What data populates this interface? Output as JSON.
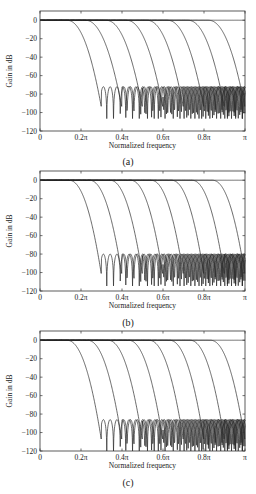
{
  "chart_data": [
    {
      "type": "line",
      "panel_label": "(a)",
      "title": "",
      "xlabel": "Normalized frequency",
      "ylabel": "Gain in dB",
      "xlim": [
        0,
        1
      ],
      "ylim": [
        -120,
        10
      ],
      "x_unit": "π",
      "xticks": [
        0,
        0.2,
        0.4,
        0.6,
        0.8,
        1.0
      ],
      "xtick_labels": [
        "0",
        "0.2π",
        "0.4π",
        "0.6π",
        "0.8π",
        "π"
      ],
      "yticks": [
        0,
        -20,
        -40,
        -60,
        -80,
        -100,
        -120
      ],
      "ytick_labels": [
        "0",
        "-20",
        "-40",
        "-60",
        "-80",
        "-100",
        "-120"
      ],
      "grid": false,
      "legend": null,
      "series_description": "Family of lowpass filter magnitude responses with passband edges stepping by 0.1π and stopband edges at 0.3π through π",
      "series": [
        {
          "name": "filter 1",
          "passband_edge": 0.13,
          "stopband_edge": 0.3,
          "stopband_peak_db": -70
        },
        {
          "name": "filter 2",
          "passband_edge": 0.22,
          "stopband_edge": 0.4,
          "stopband_peak_db": -70
        },
        {
          "name": "filter 3",
          "passband_edge": 0.32,
          "stopband_edge": 0.5,
          "stopband_peak_db": -70
        },
        {
          "name": "filter 4",
          "passband_edge": 0.42,
          "stopband_edge": 0.6,
          "stopband_peak_db": -70
        },
        {
          "name": "filter 5",
          "passband_edge": 0.52,
          "stopband_edge": 0.7,
          "stopband_peak_db": -70
        },
        {
          "name": "filter 6",
          "passband_edge": 0.62,
          "stopband_edge": 0.8,
          "stopband_peak_db": -70
        },
        {
          "name": "filter 7",
          "passband_edge": 0.72,
          "stopband_edge": 0.9,
          "stopband_peak_db": -70
        },
        {
          "name": "filter 8",
          "passband_edge": 0.82,
          "stopband_edge": 1.0,
          "stopband_peak_db": -70
        }
      ]
    },
    {
      "type": "line",
      "panel_label": "(b)",
      "title": "",
      "xlabel": "Normalized frequency",
      "ylabel": "Gain in dB",
      "xlim": [
        0,
        1
      ],
      "ylim": [
        -120,
        10
      ],
      "x_unit": "π",
      "xticks": [
        0,
        0.2,
        0.4,
        0.6,
        0.8,
        1.0
      ],
      "xtick_labels": [
        "0",
        "0.2π",
        "0.4π",
        "0.6π",
        "0.8π",
        "π"
      ],
      "yticks": [
        0,
        -20,
        -40,
        -60,
        -80,
        -100,
        -120
      ],
      "ytick_labels": [
        "0",
        "-20",
        "-40",
        "-60",
        "-80",
        "-100",
        "-120"
      ],
      "grid": false,
      "legend": null,
      "series": [
        {
          "name": "filter 1",
          "passband_edge": 0.14,
          "stopband_edge": 0.3,
          "stopband_peak_db": -78
        },
        {
          "name": "filter 2",
          "passband_edge": 0.24,
          "stopband_edge": 0.4,
          "stopband_peak_db": -78
        },
        {
          "name": "filter 3",
          "passband_edge": 0.34,
          "stopband_edge": 0.5,
          "stopband_peak_db": -78
        },
        {
          "name": "filter 4",
          "passband_edge": 0.44,
          "stopband_edge": 0.6,
          "stopband_peak_db": -78
        },
        {
          "name": "filter 5",
          "passband_edge": 0.54,
          "stopband_edge": 0.7,
          "stopband_peak_db": -78
        },
        {
          "name": "filter 6",
          "passband_edge": 0.64,
          "stopband_edge": 0.8,
          "stopband_peak_db": -78
        },
        {
          "name": "filter 7",
          "passband_edge": 0.74,
          "stopband_edge": 0.9,
          "stopband_peak_db": -78
        },
        {
          "name": "filter 8",
          "passband_edge": 0.84,
          "stopband_edge": 1.0,
          "stopband_peak_db": -78
        }
      ]
    },
    {
      "type": "line",
      "panel_label": "(c)",
      "title": "",
      "xlabel": "Normalized frequency",
      "ylabel": "Gain in dB",
      "xlim": [
        0,
        1
      ],
      "ylim": [
        -120,
        10
      ],
      "x_unit": "π",
      "xticks": [
        0,
        0.2,
        0.4,
        0.6,
        0.8,
        1.0
      ],
      "xtick_labels": [
        "0",
        "0.2π",
        "0.4π",
        "0.6π",
        "0.8π",
        "π"
      ],
      "yticks": [
        0,
        -20,
        -40,
        -60,
        -80,
        -100,
        -120
      ],
      "ytick_labels": [
        "0",
        "-20",
        "-40",
        "-60",
        "-80",
        "-100",
        "-120"
      ],
      "grid": false,
      "legend": null,
      "series": [
        {
          "name": "filter 1",
          "passband_edge": 0.13,
          "stopband_edge": 0.3,
          "stopband_peak_db": -84
        },
        {
          "name": "filter 2",
          "passband_edge": 0.23,
          "stopband_edge": 0.4,
          "stopband_peak_db": -84
        },
        {
          "name": "filter 3",
          "passband_edge": 0.33,
          "stopband_edge": 0.5,
          "stopband_peak_db": -84
        },
        {
          "name": "filter 4",
          "passband_edge": 0.43,
          "stopband_edge": 0.6,
          "stopband_peak_db": -84
        },
        {
          "name": "filter 5",
          "passband_edge": 0.53,
          "stopband_edge": 0.7,
          "stopband_peak_db": -84
        },
        {
          "name": "filter 6",
          "passband_edge": 0.63,
          "stopband_edge": 0.8,
          "stopband_peak_db": -84
        },
        {
          "name": "filter 7",
          "passband_edge": 0.73,
          "stopband_edge": 0.9,
          "stopband_peak_db": -84
        },
        {
          "name": "filter 8",
          "passband_edge": 0.83,
          "stopband_edge": 1.0,
          "stopband_peak_db": -84
        }
      ]
    }
  ],
  "panels": [
    {
      "caption": "(a)"
    },
    {
      "caption": "(b)"
    },
    {
      "caption": "(c)"
    }
  ],
  "colors": {
    "line": "#2a2a2a",
    "axis": "#333333",
    "background": "#ffffff"
  }
}
